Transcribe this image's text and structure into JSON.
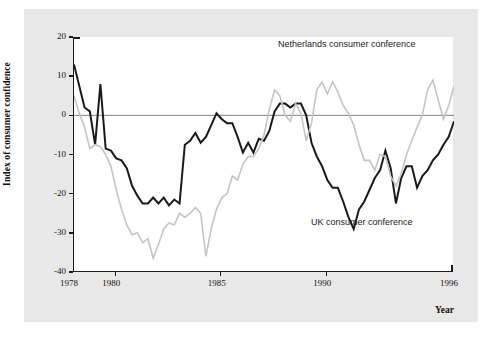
{
  "figure": {
    "background_color": "#e8e8e8",
    "plot_background_color": "#ffffff",
    "axis_color": "#1a1a1a"
  },
  "chart_data": {
    "type": "line",
    "title": "",
    "xlabel": "Year",
    "ylabel": "Index of consumer confidence",
    "xlim": [
      1978,
      1996
    ],
    "ylim": [
      -40,
      20
    ],
    "xticks": [
      1978,
      1980,
      1985,
      1990,
      1996
    ],
    "xtick_labels": [
      "1978",
      "1980",
      "1985",
      "1990",
      "1996"
    ],
    "yticks": [
      -40,
      -30,
      -20,
      -10,
      0,
      10,
      20
    ],
    "ytick_labels": [
      "-40",
      "-30",
      "-20",
      "-10",
      "0",
      "10",
      "20"
    ],
    "grid": false,
    "zero_line": true,
    "zero_line_color": "#808080",
    "legend_position": "inline-annotations",
    "annotations": [
      {
        "text": "Netherlands consumer conference",
        "x": 1988.0,
        "y": 14.0,
        "series": "netherlands"
      },
      {
        "text": "UK consumer conference",
        "x": 1989.6,
        "y": -32.0,
        "series": "uk"
      }
    ],
    "series": [
      {
        "name": "UK consumer conference",
        "color": "#1a1a1a",
        "linewidth": 2.0,
        "x": [
          1978.0,
          1978.25,
          1978.5,
          1978.75,
          1979.0,
          1979.25,
          1979.5,
          1979.75,
          1980.0,
          1980.25,
          1980.5,
          1980.75,
          1981.0,
          1981.25,
          1981.5,
          1981.75,
          1982.0,
          1982.25,
          1982.5,
          1982.75,
          1983.0,
          1983.25,
          1983.5,
          1983.75,
          1984.0,
          1984.25,
          1984.5,
          1984.75,
          1985.0,
          1985.25,
          1985.5,
          1985.75,
          1986.0,
          1986.25,
          1986.5,
          1986.75,
          1987.0,
          1987.25,
          1987.5,
          1987.75,
          1988.0,
          1988.25,
          1988.5,
          1988.75,
          1989.0,
          1989.25,
          1989.5,
          1989.75,
          1990.0,
          1990.25,
          1990.5,
          1990.75,
          1991.0,
          1991.25,
          1991.5,
          1991.75,
          1992.0,
          1992.25,
          1992.5,
          1992.75,
          1993.0,
          1993.25,
          1993.5,
          1993.75,
          1994.0,
          1994.25,
          1994.5,
          1994.75,
          1995.0,
          1995.25,
          1995.5,
          1995.75,
          1996.0
        ],
        "y": [
          13.0,
          7.5,
          2.0,
          1.0,
          -7.5,
          8.0,
          -8.5,
          -9.0,
          -11.0,
          -11.5,
          -13.5,
          -18.0,
          -20.5,
          -22.5,
          -22.5,
          -21.0,
          -22.5,
          -21.0,
          -23.0,
          -21.5,
          -22.5,
          -7.5,
          -6.5,
          -4.5,
          -7.0,
          -5.5,
          -2.5,
          0.5,
          -1.0,
          -2.0,
          -2.0,
          -5.5,
          -9.5,
          -7.0,
          -9.5,
          -6.0,
          -6.5,
          -4.0,
          1.0,
          3.0,
          3.0,
          2.0,
          3.0,
          3.0,
          0.0,
          -7.0,
          -10.5,
          -13.0,
          -16.5,
          -18.5,
          -18.5,
          -22.0,
          -26.0,
          -29.0,
          -24.0,
          -22.0,
          -19.0,
          -16.0,
          -14.0,
          -9.0,
          -13.5,
          -22.5,
          -16.0,
          -13.0,
          -13.0,
          -18.5,
          -15.5,
          -14.0,
          -11.5,
          -10.0,
          -7.5,
          -5.5,
          -1.5
        ]
      },
      {
        "name": "Netherlands consumer conference",
        "color": "#c4c4c4",
        "linewidth": 1.6,
        "x": [
          1978.0,
          1978.25,
          1978.5,
          1978.75,
          1979.0,
          1979.25,
          1979.5,
          1979.75,
          1980.0,
          1980.25,
          1980.5,
          1980.75,
          1981.0,
          1981.25,
          1981.5,
          1981.75,
          1982.0,
          1982.25,
          1982.5,
          1982.75,
          1983.0,
          1983.25,
          1983.5,
          1983.75,
          1984.0,
          1984.25,
          1984.5,
          1984.75,
          1985.0,
          1985.25,
          1985.5,
          1985.75,
          1986.0,
          1986.25,
          1986.5,
          1986.75,
          1987.0,
          1987.25,
          1987.5,
          1987.75,
          1988.0,
          1988.25,
          1988.5,
          1988.75,
          1989.0,
          1989.25,
          1989.5,
          1989.75,
          1990.0,
          1990.25,
          1990.5,
          1990.75,
          1991.0,
          1991.25,
          1991.5,
          1991.75,
          1992.0,
          1992.25,
          1992.5,
          1992.75,
          1993.0,
          1993.25,
          1993.5,
          1993.75,
          1994.0,
          1994.25,
          1994.5,
          1994.75,
          1995.0,
          1995.25,
          1995.5,
          1995.75,
          1996.0
        ],
        "y": [
          5.0,
          0.5,
          -3.0,
          -8.5,
          -7.5,
          -8.0,
          -10.0,
          -13.0,
          -19.0,
          -24.0,
          -28.0,
          -30.5,
          -30.0,
          -32.5,
          -31.5,
          -36.5,
          -33.0,
          -29.0,
          -27.5,
          -28.0,
          -25.0,
          -26.0,
          -25.0,
          -23.5,
          -25.0,
          -36.0,
          -29.0,
          -24.0,
          -21.0,
          -20.0,
          -15.5,
          -16.5,
          -12.5,
          -10.5,
          -10.5,
          -8.5,
          -5.0,
          1.5,
          6.5,
          5.0,
          0.0,
          -1.5,
          3.0,
          0.5,
          -6.5,
          -2.0,
          6.5,
          8.5,
          5.5,
          8.5,
          6.0,
          2.5,
          0.5,
          -2.5,
          -7.5,
          -11.5,
          -11.5,
          -14.0,
          -10.0,
          -10.5,
          -15.5,
          -18.0,
          -15.0,
          -10.0,
          -6.5,
          -3.0,
          0.0,
          6.5,
          9.0,
          4.0,
          -1.0,
          2.5,
          7.5
        ]
      }
    ]
  }
}
